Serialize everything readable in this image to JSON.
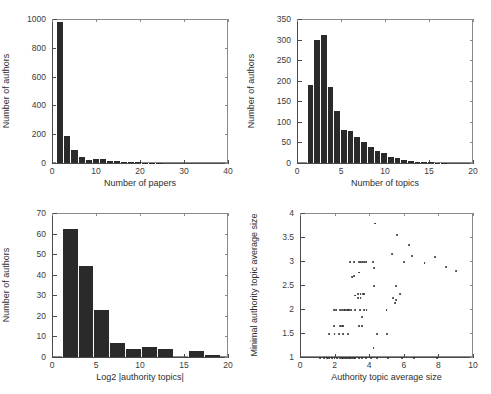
{
  "figure": {
    "width": 491,
    "height": 394,
    "background": "#ffffff",
    "bar_color": "#2a2a2a",
    "marker_color": "#2b2b2b",
    "axis_color": "#8a8a8a"
  },
  "chart_data": [
    {
      "id": "papers-per-author",
      "type": "bar",
      "title": "",
      "xlabel": "Number of papers",
      "ylabel": "Number of authors",
      "xlim": [
        0,
        40
      ],
      "ylim": [
        0,
        1000
      ],
      "xticks": [
        0,
        10,
        20,
        30,
        40
      ],
      "xticklabels": [
        "0",
        "10",
        "20",
        "30",
        "40"
      ],
      "yticks": [
        0,
        200,
        400,
        600,
        800,
        1000
      ],
      "yticklabels": [
        "0",
        "200",
        "400",
        "600",
        "800",
        "1000"
      ],
      "grid": false,
      "bin_width": 1.6,
      "bin_starts": [
        1.0,
        2.6,
        4.2,
        5.8,
        7.4,
        9.0,
        10.6,
        12.2,
        13.8,
        15.4,
        17.0,
        18.6,
        20.2,
        21.8,
        23.4
      ],
      "values": [
        980,
        190,
        88,
        42,
        22,
        26,
        25,
        14,
        12,
        6,
        5,
        4,
        3,
        1,
        1
      ]
    },
    {
      "id": "topics-per-author",
      "type": "bar",
      "title": "",
      "xlabel": "Number of topics",
      "ylabel": "Number of authors",
      "xlim": [
        0,
        20
      ],
      "ylim": [
        0,
        350
      ],
      "xticks": [
        0,
        5,
        10,
        15,
        20
      ],
      "xticklabels": [
        "0",
        "5",
        "10",
        "15",
        "20"
      ],
      "yticks": [
        0,
        50,
        100,
        150,
        200,
        250,
        300,
        350
      ],
      "yticklabels": [
        "0",
        "50",
        "100",
        "150",
        "200",
        "250",
        "300",
        "350"
      ],
      "grid": false,
      "bin_width": 0.76,
      "bin_starts": [
        1.1,
        1.86,
        2.62,
        3.38,
        4.14,
        4.9,
        5.66,
        6.42,
        7.18,
        7.94,
        8.7,
        9.46,
        10.22,
        10.98,
        11.74,
        12.5,
        13.26,
        14.02,
        14.78,
        15.54,
        16.3,
        17.06,
        17.82,
        18.58
      ],
      "values": [
        190,
        300,
        312,
        184,
        126,
        79,
        78,
        62,
        50,
        38,
        29,
        24,
        15,
        11,
        8,
        4,
        3,
        3,
        2,
        1,
        1,
        0,
        0,
        0
      ]
    },
    {
      "id": "log2-authority-topics",
      "type": "bar",
      "title": "",
      "xlabel": "Log2 |authority topics|",
      "ylabel": "Number of authors",
      "xlim": [
        0,
        20
      ],
      "ylim": [
        0,
        70
      ],
      "xticks": [
        0,
        5,
        10,
        15,
        20
      ],
      "xticklabels": [
        "0",
        "5",
        "10",
        "15",
        "20"
      ],
      "yticks": [
        0,
        10,
        20,
        30,
        40,
        50,
        60,
        70
      ],
      "yticklabels": [
        "0",
        "10",
        "20",
        "30",
        "40",
        "50",
        "60",
        "70"
      ],
      "grid": false,
      "bin_width": 1.8,
      "bin_starts": [
        1.1,
        2.9,
        4.7,
        6.5,
        8.3,
        10.1,
        11.9,
        13.7,
        15.5,
        17.3
      ],
      "values": [
        62,
        44,
        23,
        7,
        4,
        5,
        4,
        0,
        3,
        1
      ]
    },
    {
      "id": "authority-topic-size-scatter",
      "type": "scatter",
      "title": "",
      "xlabel": "Authority topic average size",
      "ylabel": "Minimal authority topic average size",
      "xlim": [
        0,
        10
      ],
      "ylim": [
        1,
        4
      ],
      "xticks": [
        0,
        2,
        4,
        6,
        8,
        10
      ],
      "xticklabels": [
        "0",
        "2",
        "4",
        "6",
        "8",
        "10"
      ],
      "yticks": [
        1,
        1.5,
        2,
        2.5,
        3,
        3.5,
        4
      ],
      "yticklabels": [
        "1",
        "1.5",
        "2",
        "2.5",
        "3",
        "3.5",
        "4"
      ],
      "grid": false,
      "marker": "dot",
      "points": [
        [
          1.15,
          1.0
        ],
        [
          1.4,
          1.0
        ],
        [
          1.55,
          1.0
        ],
        [
          1.7,
          1.0
        ],
        [
          1.85,
          1.0
        ],
        [
          2.0,
          1.0
        ],
        [
          2.15,
          1.0
        ],
        [
          2.3,
          1.0
        ],
        [
          2.42,
          1.0
        ],
        [
          2.5,
          1.0
        ],
        [
          2.6,
          1.0
        ],
        [
          2.68,
          1.0
        ],
        [
          2.76,
          1.0
        ],
        [
          2.84,
          1.0
        ],
        [
          2.92,
          1.0
        ],
        [
          3.0,
          1.0
        ],
        [
          3.1,
          1.0
        ],
        [
          3.2,
          1.0
        ],
        [
          3.4,
          1.0
        ],
        [
          3.6,
          1.0
        ],
        [
          3.8,
          1.0
        ],
        [
          4.1,
          1.0
        ],
        [
          4.45,
          1.0
        ],
        [
          5.1,
          1.0
        ],
        [
          5.9,
          1.0
        ],
        [
          6.6,
          1.0
        ],
        [
          7.9,
          1.0
        ],
        [
          1.7,
          1.5
        ],
        [
          2.0,
          1.5
        ],
        [
          2.25,
          1.5
        ],
        [
          2.5,
          1.5
        ],
        [
          2.8,
          1.5
        ],
        [
          4.45,
          1.5
        ],
        [
          5.05,
          1.5
        ],
        [
          1.95,
          1.66
        ],
        [
          2.3,
          1.66
        ],
        [
          2.42,
          1.66
        ],
        [
          2.5,
          1.66
        ],
        [
          3.4,
          1.66
        ],
        [
          3.6,
          1.66
        ],
        [
          3.6,
          1.85
        ],
        [
          1.95,
          2.0
        ],
        [
          2.1,
          2.0
        ],
        [
          2.3,
          2.0
        ],
        [
          2.45,
          2.0
        ],
        [
          2.55,
          2.0
        ],
        [
          2.62,
          2.0
        ],
        [
          2.7,
          2.0
        ],
        [
          2.78,
          2.0
        ],
        [
          2.86,
          2.0
        ],
        [
          2.95,
          2.0
        ],
        [
          3.2,
          2.0
        ],
        [
          3.45,
          2.0
        ],
        [
          3.7,
          2.0
        ],
        [
          3.85,
          2.0
        ],
        [
          5.0,
          2.0
        ],
        [
          5.5,
          2.15
        ],
        [
          5.55,
          2.2
        ],
        [
          5.4,
          2.25
        ],
        [
          3.2,
          2.3
        ],
        [
          3.35,
          2.33
        ],
        [
          3.5,
          2.33
        ],
        [
          3.62,
          2.33
        ],
        [
          3.72,
          2.33
        ],
        [
          3.35,
          2.25
        ],
        [
          3.5,
          2.25
        ],
        [
          5.8,
          2.33
        ],
        [
          4.3,
          2.5
        ],
        [
          5.55,
          2.5
        ],
        [
          3.0,
          2.68
        ],
        [
          3.15,
          2.7
        ],
        [
          3.4,
          2.78
        ],
        [
          8.45,
          2.9
        ],
        [
          9.0,
          2.82
        ],
        [
          4.3,
          2.88
        ],
        [
          2.9,
          3.0
        ],
        [
          3.1,
          3.0
        ],
        [
          3.4,
          3.0
        ],
        [
          3.5,
          3.0
        ],
        [
          3.6,
          3.0
        ],
        [
          3.7,
          3.0
        ],
        [
          3.8,
          3.0
        ],
        [
          4.2,
          3.0
        ],
        [
          6.0,
          3.0
        ],
        [
          7.2,
          2.97
        ],
        [
          7.8,
          3.1
        ],
        [
          6.5,
          3.13
        ],
        [
          5.3,
          3.17
        ],
        [
          6.3,
          3.35
        ],
        [
          5.6,
          3.57
        ],
        [
          4.35,
          3.8
        ],
        [
          4.25,
          1.2
        ]
      ]
    }
  ]
}
